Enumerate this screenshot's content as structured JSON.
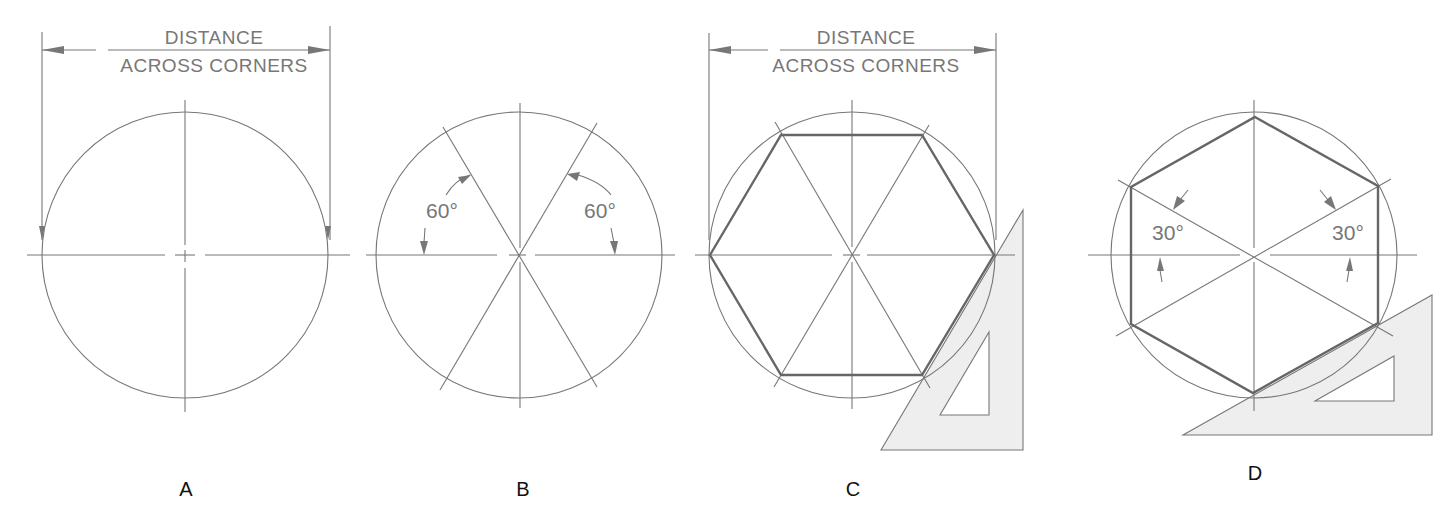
{
  "figure": {
    "panels": [
      {
        "id": "A",
        "label": "A",
        "dimension_text": [
          "DISTANCE",
          "ACROSS CORNERS"
        ],
        "description": "Circle with center lines; diameter equals distance across corners"
      },
      {
        "id": "B",
        "label": "B",
        "angle_labels": [
          "60°",
          "60°"
        ],
        "description": "Circle with lines drawn at 60° through center"
      },
      {
        "id": "C",
        "label": "C",
        "dimension_text": [
          "DISTANCE",
          "ACROSS CORNERS"
        ],
        "description": "Hexagon inscribed in circle using 30-60 triangle"
      },
      {
        "id": "D",
        "label": "D",
        "angle_labels": [
          "30°",
          "30°"
        ],
        "description": "Hexagon with vertical sides drawn using 30° lines and triangle"
      }
    ],
    "colors": {
      "line": "#777777",
      "hexagon": "#666666",
      "triangle_fill": "#eeeeee",
      "label": "#111111"
    }
  }
}
